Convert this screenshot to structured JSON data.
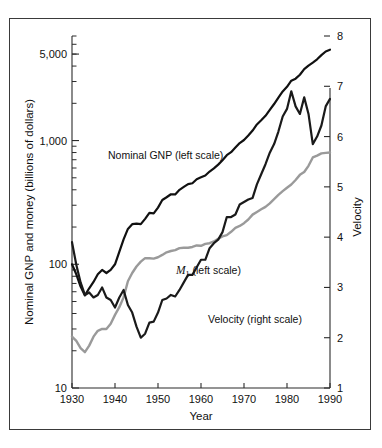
{
  "figure": {
    "background_color": "#ffffff",
    "frame_color": "#3a3a3a"
  },
  "chart_data": {
    "type": "line",
    "title": "",
    "xlabel": "Year",
    "ylabel": "Nominal GNP and money (billions of dollars)",
    "y2label": "Velocity",
    "grid": false,
    "legend_position": "inline-annotations",
    "x": [
      1930,
      1931,
      1932,
      1933,
      1934,
      1935,
      1936,
      1937,
      1938,
      1939,
      1940,
      1941,
      1942,
      1943,
      1944,
      1945,
      1946,
      1947,
      1948,
      1949,
      1950,
      1951,
      1952,
      1953,
      1954,
      1955,
      1956,
      1957,
      1958,
      1959,
      1960,
      1961,
      1962,
      1963,
      1964,
      1965,
      1966,
      1967,
      1968,
      1969,
      1970,
      1971,
      1972,
      1973,
      1974,
      1975,
      1976,
      1977,
      1978,
      1979,
      1980,
      1981,
      1982,
      1983,
      1984,
      1985,
      1986,
      1987,
      1988,
      1989,
      1990
    ],
    "xlim": [
      1930,
      1990
    ],
    "xticks": [
      1930,
      1940,
      1950,
      1960,
      1970,
      1980,
      1990
    ],
    "xticklabels": [
      "1930",
      "1940",
      "1950",
      "1960",
      "1970",
      "1980",
      "1990"
    ],
    "yscale": "log",
    "ylim": [
      10,
      7000
    ],
    "yticks": [
      10,
      100,
      1000,
      5000
    ],
    "yticklabels": [
      "10",
      "100",
      "1,000",
      "5,000"
    ],
    "y2lim": [
      1,
      8
    ],
    "y2ticks": [
      1,
      2,
      3,
      4,
      5,
      6,
      7,
      8
    ],
    "y2ticklabels": [
      "1",
      "2",
      "3",
      "4",
      "5",
      "6",
      "7",
      "8"
    ],
    "series": [
      {
        "name": "Nominal GNP (left scale)",
        "axis": "left",
        "color": "#111111",
        "width": 2.2,
        "values": [
          100,
          83,
          66,
          56,
          64,
          72,
          83,
          90,
          85,
          90,
          100,
          126,
          159,
          193,
          211,
          213,
          211,
          233,
          260,
          258,
          287,
          331,
          348,
          368,
          367,
          400,
          422,
          445,
          452,
          487,
          505,
          522,
          562,
          596,
          639,
          694,
          762,
          806,
          879,
          955,
          1010,
          1097,
          1205,
          1349,
          1459,
          1586,
          1771,
          1974,
          2227,
          2496,
          2718,
          3047,
          3164,
          3404,
          3777,
          4039,
          4269,
          4540,
          4900,
          5250,
          5420
        ]
      },
      {
        "name": "M1 (left scale)",
        "axis": "left",
        "color": "#9a9a9a",
        "width": 2.4,
        "values": [
          26,
          24,
          21,
          19.5,
          22,
          26,
          29,
          30,
          30,
          33,
          39,
          45,
          54,
          73,
          85,
          96,
          105,
          112,
          112,
          111,
          114,
          119,
          125,
          128,
          130,
          135,
          136,
          136,
          138,
          142,
          141,
          146,
          148,
          153,
          161,
          168,
          172,
          183,
          197,
          204,
          215,
          230,
          252,
          265,
          278,
          291,
          311,
          336,
          364,
          390,
          415,
          441,
          480,
          528,
          557,
          625,
          730,
          755,
          787,
          795,
          800
        ]
      },
      {
        "name": "Velocity (right scale)",
        "axis": "right",
        "color": "#1a1a1a",
        "width": 2.2,
        "values": [
          3.9,
          3.45,
          3.1,
          2.85,
          2.9,
          2.8,
          2.85,
          3.0,
          2.8,
          2.75,
          2.6,
          2.8,
          2.95,
          2.65,
          2.5,
          2.22,
          2.0,
          2.08,
          2.3,
          2.32,
          2.5,
          2.75,
          2.78,
          2.85,
          2.82,
          2.95,
          3.1,
          3.25,
          3.25,
          3.4,
          3.55,
          3.55,
          3.78,
          3.88,
          3.95,
          4.1,
          4.4,
          4.4,
          4.45,
          4.65,
          4.7,
          4.75,
          4.78,
          5.05,
          5.25,
          5.45,
          5.68,
          5.85,
          6.1,
          6.4,
          6.55,
          6.9,
          6.6,
          6.45,
          6.78,
          6.45,
          5.85,
          6.0,
          6.22,
          6.6,
          6.75
        ]
      }
    ],
    "annotations": [
      {
        "text": "Nominal GNP (left scale)",
        "x_px": 108,
        "y_px": 159
      },
      {
        "text_italic": "M",
        "text_sub": "1",
        "text": " (left scale)",
        "x_px": 176,
        "y_px": 274
      },
      {
        "text": "Velocity (right scale)",
        "x_px": 208,
        "y_px": 323
      }
    ]
  },
  "axes": {
    "x_title": "Year",
    "y_left_title": "Nominal GNP and money (billions of dollars)",
    "y_right_title": "Velocity"
  }
}
